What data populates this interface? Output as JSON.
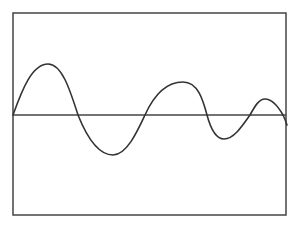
{
  "figure": {
    "colors": {
      "background": "#ffffff",
      "frame": "#444444",
      "baseline": "#444444",
      "wave": "#333333"
    },
    "frame": {
      "x": 13,
      "y": 13,
      "width": 273,
      "height": 202
    },
    "baseline": {
      "y": 115,
      "x1": 13,
      "x2": 286
    },
    "wave_path": "M13,115 C22,90 32,64 48,64 C62,64 70,90 78,115 C88,140 100,155 113,155 C127,155 138,130 145,115 C154,95 166,82 183,82 C198,82 203,100 207,115 C211,130 216,139 224,139 C234,139 243,125 250,115 C255,106 259,99 265,99 C273,99 279,108 283,115 C285,119 286,122 287,125",
    "wave_points": [
      {
        "x": 13,
        "y": 115,
        "label": "start"
      },
      {
        "x": 48,
        "y": 64,
        "label": "peak-1"
      },
      {
        "x": 78,
        "y": 115,
        "label": "zero-crossing"
      },
      {
        "x": 113,
        "y": 155,
        "label": "trough-1"
      },
      {
        "x": 145,
        "y": 115,
        "label": "zero-crossing"
      },
      {
        "x": 183,
        "y": 82,
        "label": "peak-2"
      },
      {
        "x": 207,
        "y": 115,
        "label": "zero-crossing"
      },
      {
        "x": 224,
        "y": 139,
        "label": "trough-2"
      },
      {
        "x": 250,
        "y": 115,
        "label": "zero-crossing"
      },
      {
        "x": 265,
        "y": 99,
        "label": "peak-3"
      },
      {
        "x": 283,
        "y": 115,
        "label": "zero-crossing"
      },
      {
        "x": 287,
        "y": 125,
        "label": "end"
      }
    ]
  }
}
